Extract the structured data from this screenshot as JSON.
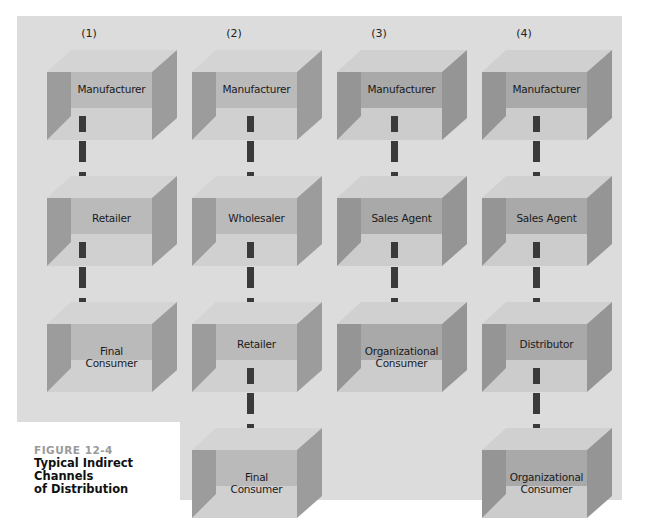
{
  "figure": {
    "number": "FIGURE 12-4",
    "title_line1": "Typical Indirect Channels",
    "title_line2": "of Distribution"
  },
  "colors": {
    "panel_bg": "#dcdcdc",
    "box_top": "#d2d2d2",
    "box_band": "#b9b9b9",
    "box_wall": "#9a9a9a",
    "box_floor": "#cfcfcf",
    "connector": "#3a3a3a"
  },
  "channels": [
    {
      "header": "(1)",
      "nodes": [
        {
          "line1": "Manufacturer",
          "line2": ""
        },
        {
          "line1": "Retailer",
          "line2": ""
        },
        {
          "line1": "Final",
          "line2": "Consumer"
        }
      ]
    },
    {
      "header": "(2)",
      "nodes": [
        {
          "line1": "Manufacturer",
          "line2": ""
        },
        {
          "line1": "Wholesaler",
          "line2": ""
        },
        {
          "line1": "Retailer",
          "line2": ""
        },
        {
          "line1": "Final",
          "line2": "Consumer"
        }
      ]
    },
    {
      "header": "(3)",
      "nodes": [
        {
          "line1": "Manufacturer",
          "line2": ""
        },
        {
          "line1": "Sales Agent",
          "line2": ""
        },
        {
          "line1": "Organizational",
          "line2": "Consumer"
        }
      ]
    },
    {
      "header": "(4)",
      "nodes": [
        {
          "line1": "Manufacturer",
          "line2": ""
        },
        {
          "line1": "Sales Agent",
          "line2": ""
        },
        {
          "line1": "Distributor",
          "line2": ""
        },
        {
          "line1": "Organizational",
          "line2": "Consumer"
        }
      ]
    }
  ]
}
